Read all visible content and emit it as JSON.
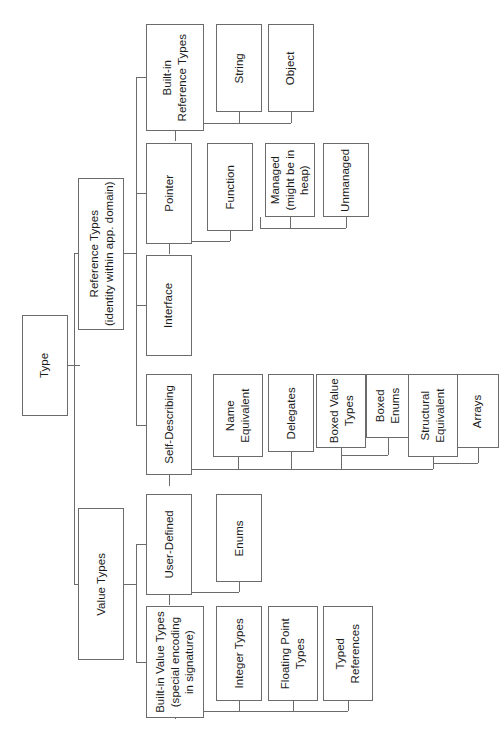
{
  "diagram": {
    "title": "Type",
    "orientation": "rotated-90-left",
    "root": "Type",
    "nodes": [
      {
        "id": "type",
        "label": "Type",
        "x": 22,
        "y": 315,
        "w": 46,
        "h": 101
      },
      {
        "id": "reference_types",
        "label": "Reference Types\n(identity within app. domain)",
        "x": 78,
        "y": 178,
        "w": 46,
        "h": 152
      },
      {
        "id": "value_types",
        "label": "Value Types",
        "x": 78,
        "y": 508,
        "w": 46,
        "h": 152
      },
      {
        "id": "builtin_ref",
        "label": "Built-in\nReference Types",
        "x": 146,
        "y": 24,
        "w": 58,
        "h": 107
      },
      {
        "id": "pointer",
        "label": "Pointer",
        "x": 146,
        "y": 143,
        "w": 46,
        "h": 101
      },
      {
        "id": "interface",
        "label": "Interface",
        "x": 146,
        "y": 255,
        "w": 46,
        "h": 101
      },
      {
        "id": "self_describing",
        "label": "Self-Describing",
        "x": 146,
        "y": 374,
        "w": 46,
        "h": 101
      },
      {
        "id": "user_defined",
        "label": "User-Defined",
        "x": 146,
        "y": 494,
        "w": 46,
        "h": 101
      },
      {
        "id": "builtin_value",
        "label": "Built-in Value Types\n(special encoding\nin signature)",
        "x": 146,
        "y": 606,
        "w": 58,
        "h": 112
      },
      {
        "id": "string",
        "label": "String",
        "x": 216,
        "y": 24,
        "w": 46,
        "h": 88
      },
      {
        "id": "object",
        "label": "Object",
        "x": 268,
        "y": 24,
        "w": 46,
        "h": 88
      },
      {
        "id": "function",
        "label": "Function",
        "x": 207,
        "y": 143,
        "w": 46,
        "h": 88
      },
      {
        "id": "managed",
        "label": "Managed\n(might be in\nheap)",
        "x": 265,
        "y": 143,
        "w": 50,
        "h": 74
      },
      {
        "id": "unmanaged",
        "label": "Unmanaged",
        "x": 323,
        "y": 143,
        "w": 46,
        "h": 74
      },
      {
        "id": "name_equiv",
        "label": "Name\nEquivalent",
        "x": 213,
        "y": 374,
        "w": 50,
        "h": 83
      },
      {
        "id": "delegates",
        "label": "Delegates",
        "x": 268,
        "y": 374,
        "w": 46,
        "h": 78
      },
      {
        "id": "boxed_value",
        "label": "Boxed Value\nTypes",
        "x": 316,
        "y": 374,
        "w": 50,
        "h": 74
      },
      {
        "id": "boxed_enums",
        "label": "Boxed\nEnums",
        "x": 366,
        "y": 374,
        "w": 44,
        "h": 64
      },
      {
        "id": "struct_equiv",
        "label": "Structural\nEquivalent",
        "x": 408,
        "y": 374,
        "w": 50,
        "h": 83
      },
      {
        "id": "arrays",
        "label": "Arrays",
        "x": 457,
        "y": 374,
        "w": 42,
        "h": 74
      },
      {
        "id": "enums",
        "label": "Enums",
        "x": 216,
        "y": 494,
        "w": 46,
        "h": 88
      },
      {
        "id": "integer_types",
        "label": "Integer Types",
        "x": 216,
        "y": 606,
        "w": 46,
        "h": 95
      },
      {
        "id": "floating_point",
        "label": "Floating Point\nTypes",
        "x": 268,
        "y": 606,
        "w": 50,
        "h": 95
      },
      {
        "id": "typed_refs",
        "label": "Typed\nReferences",
        "x": 323,
        "y": 606,
        "w": 50,
        "h": 95
      }
    ],
    "edges": [
      {
        "from": "type",
        "to": [
          "reference_types",
          "value_types"
        ]
      },
      {
        "from": "reference_types",
        "to": [
          "builtin_ref",
          "pointer",
          "interface",
          "self_describing"
        ]
      },
      {
        "from": "value_types",
        "to": [
          "user_defined",
          "builtin_value"
        ]
      },
      {
        "from": "builtin_ref",
        "to": [
          "string",
          "object"
        ]
      },
      {
        "from": "pointer",
        "to": [
          "function"
        ]
      },
      {
        "from": "function",
        "to": [
          "managed",
          "unmanaged"
        ]
      },
      {
        "from": "self_describing",
        "to": [
          "name_equiv",
          "delegates",
          "boxed_value",
          "struct_equiv"
        ]
      },
      {
        "from": "boxed_value",
        "to": [
          "boxed_enums"
        ]
      },
      {
        "from": "struct_equiv",
        "to": [
          "arrays"
        ]
      },
      {
        "from": "user_defined",
        "to": [
          "enums"
        ]
      },
      {
        "from": "builtin_value",
        "to": [
          "integer_types",
          "floating_point",
          "typed_refs"
        ]
      }
    ],
    "connectors": [
      {
        "id": "type-stub",
        "type": "h",
        "x": 68,
        "y": 365,
        "w": 12,
        "h": 1
      },
      {
        "id": "type-bus",
        "type": "v",
        "x": 74,
        "y": 253,
        "w": 1,
        "h": 331
      },
      {
        "id": "type-to-ref",
        "type": "h",
        "x": 74,
        "y": 253,
        "w": 6,
        "h": 1
      },
      {
        "id": "type-to-val",
        "type": "h",
        "x": 74,
        "y": 584,
        "w": 6,
        "h": 1
      },
      {
        "id": "ref-stub",
        "type": "h",
        "x": 124,
        "y": 253,
        "w": 12,
        "h": 1
      },
      {
        "id": "ref-bus",
        "type": "v",
        "x": 136,
        "y": 77,
        "w": 1,
        "h": 348
      },
      {
        "id": "ref-to-builtin",
        "type": "h",
        "x": 136,
        "y": 77,
        "w": 10,
        "h": 1
      },
      {
        "id": "ref-to-pointer",
        "type": "h",
        "x": 136,
        "y": 193,
        "w": 10,
        "h": 1
      },
      {
        "id": "ref-to-interface",
        "type": "h",
        "x": 136,
        "y": 305,
        "w": 10,
        "h": 1
      },
      {
        "id": "ref-to-self",
        "type": "h",
        "x": 136,
        "y": 425,
        "w": 10,
        "h": 1
      },
      {
        "id": "val-stub",
        "type": "h",
        "x": 124,
        "y": 584,
        "w": 12,
        "h": 1
      },
      {
        "id": "val-bus",
        "type": "v",
        "x": 136,
        "y": 544,
        "w": 1,
        "h": 118
      },
      {
        "id": "val-to-user",
        "type": "h",
        "x": 136,
        "y": 544,
        "w": 10,
        "h": 1
      },
      {
        "id": "val-to-bvt",
        "type": "h",
        "x": 136,
        "y": 662,
        "w": 10,
        "h": 1
      },
      {
        "id": "bir-stub",
        "type": "v",
        "x": 175,
        "y": 131,
        "w": 1,
        "h": 10
      },
      {
        "id": "bir-bus",
        "type": "h",
        "x": 175,
        "y": 123,
        "w": 116,
        "h": 1
      },
      {
        "id": "bir-to-string",
        "type": "v",
        "x": 239,
        "y": 112,
        "w": 1,
        "h": 11
      },
      {
        "id": "bir-to-object",
        "type": "v",
        "x": 291,
        "y": 112,
        "w": 1,
        "h": 11
      },
      {
        "id": "ptr-stub",
        "type": "v",
        "x": 169,
        "y": 244,
        "w": 1,
        "h": 10
      },
      {
        "id": "ptr-bus",
        "type": "h",
        "x": 169,
        "y": 241,
        "w": 61,
        "h": 1
      },
      {
        "id": "ptr-to-func",
        "type": "v",
        "x": 230,
        "y": 231,
        "w": 1,
        "h": 10
      },
      {
        "id": "func-stub",
        "type": "v",
        "x": 230,
        "y": 231,
        "w": 1,
        "h": 1
      },
      {
        "id": "func-bus",
        "type": "h",
        "x": 260,
        "y": 228,
        "w": 86,
        "h": 1
      },
      {
        "id": "func-down",
        "type": "v",
        "x": 260,
        "y": 217,
        "w": 1,
        "h": 11
      },
      {
        "id": "func-to-managed",
        "type": "v",
        "x": 290,
        "y": 217,
        "w": 1,
        "h": 11
      },
      {
        "id": "func-to-unman",
        "type": "v",
        "x": 346,
        "y": 217,
        "w": 1,
        "h": 11
      },
      {
        "id": "sd-stub",
        "type": "v",
        "x": 169,
        "y": 475,
        "w": 1,
        "h": 11
      },
      {
        "id": "sd-bus",
        "type": "h",
        "x": 169,
        "y": 469,
        "w": 264,
        "h": 1
      },
      {
        "id": "sd-to-name",
        "type": "v",
        "x": 238,
        "y": 457,
        "w": 1,
        "h": 12
      },
      {
        "id": "sd-to-deleg",
        "type": "v",
        "x": 291,
        "y": 452,
        "w": 1,
        "h": 17
      },
      {
        "id": "sd-to-bvt",
        "type": "v",
        "x": 341,
        "y": 448,
        "w": 1,
        "h": 21
      },
      {
        "id": "sd-to-struct",
        "type": "v",
        "x": 433,
        "y": 457,
        "w": 1,
        "h": 12
      },
      {
        "id": "bvt-bus",
        "type": "h",
        "x": 341,
        "y": 455,
        "w": 47,
        "h": 1
      },
      {
        "id": "bvt-to-benums",
        "type": "v",
        "x": 388,
        "y": 438,
        "w": 1,
        "h": 17
      },
      {
        "id": "se-bus",
        "type": "h",
        "x": 433,
        "y": 463,
        "w": 45,
        "h": 1
      },
      {
        "id": "se-to-arrays",
        "type": "v",
        "x": 478,
        "y": 448,
        "w": 1,
        "h": 15
      },
      {
        "id": "ud-stub",
        "type": "v",
        "x": 169,
        "y": 595,
        "w": 1,
        "h": 10
      },
      {
        "id": "ud-bus",
        "type": "h",
        "x": 169,
        "y": 592,
        "w": 70,
        "h": 1
      },
      {
        "id": "ud-to-enums",
        "type": "v",
        "x": 239,
        "y": 582,
        "w": 1,
        "h": 10
      },
      {
        "id": "bvt2-stub",
        "type": "v",
        "x": 175,
        "y": 718,
        "w": 1,
        "h": 1
      },
      {
        "id": "bvt2-bus",
        "type": "h",
        "x": 175,
        "y": 711,
        "w": 173,
        "h": 1
      },
      {
        "id": "bvt2-down",
        "type": "v",
        "x": 175,
        "y": 711,
        "w": 1,
        "h": 8
      },
      {
        "id": "bvt2-to-int",
        "type": "v",
        "x": 239,
        "y": 701,
        "w": 1,
        "h": 10
      },
      {
        "id": "bvt2-to-float",
        "type": "v",
        "x": 293,
        "y": 701,
        "w": 1,
        "h": 10
      },
      {
        "id": "bvt2-to-typed",
        "type": "v",
        "x": 348,
        "y": 701,
        "w": 1,
        "h": 10
      }
    ]
  }
}
